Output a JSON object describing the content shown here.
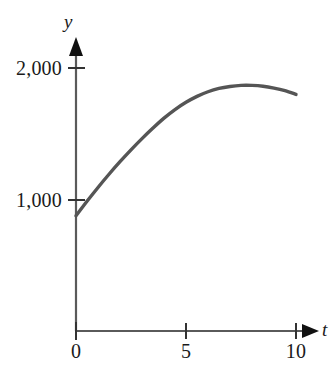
{
  "chart_data": {
    "type": "line",
    "title": "",
    "subtitle": "",
    "xlabel": "t",
    "ylabel": "y",
    "xlim": [
      0,
      10.8
    ],
    "ylim": [
      0,
      2250
    ],
    "grid": false,
    "legend": null,
    "annotations": [],
    "x_ticks": [
      {
        "value": 0,
        "label": "0"
      },
      {
        "value": 5,
        "label": "5"
      },
      {
        "value": 10,
        "label": "10"
      }
    ],
    "y_ticks": [
      {
        "value": 1000,
        "label": "1,000"
      },
      {
        "value": 2000,
        "label": "2,000"
      }
    ],
    "series": [
      {
        "name": "y(t)",
        "color": "#555555",
        "line_width": 3.4,
        "x": [
          0,
          0.5,
          1,
          1.5,
          2,
          2.5,
          3,
          3.5,
          4,
          4.5,
          5,
          5.5,
          6,
          6.5,
          7,
          7.5,
          8,
          8.5,
          9,
          9.5,
          10
        ],
        "values": [
          880,
          990,
          1095,
          1195,
          1290,
          1380,
          1465,
          1545,
          1620,
          1685,
          1740,
          1785,
          1820,
          1845,
          1860,
          1868,
          1868,
          1862,
          1848,
          1828,
          1800
        ]
      }
    ],
    "axis_style": {
      "axis_color": "#5a5a5a",
      "arrow_color": "#111111",
      "tick_color": "#333333",
      "background": "#ffffff"
    }
  },
  "labels": {
    "y_axis_name": "y",
    "x_axis_name": "t",
    "y_tick_2000": "2,000",
    "y_tick_1000": "1,000",
    "x_tick_0": "0",
    "x_tick_5": "5",
    "x_tick_10": "10"
  }
}
